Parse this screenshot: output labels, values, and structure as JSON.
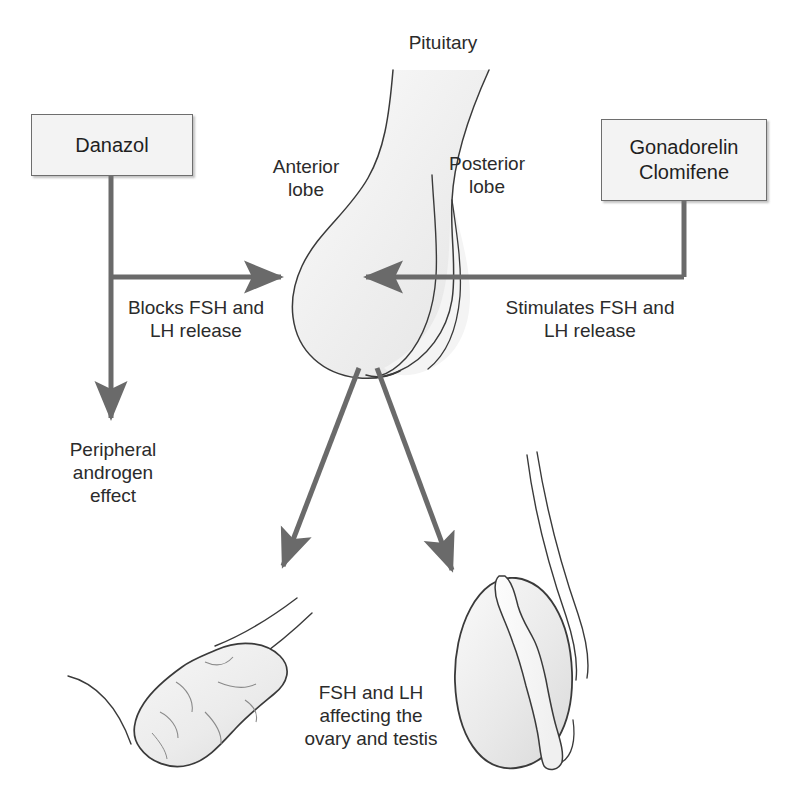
{
  "diagram": {
    "colors": {
      "arrow": "#6a6a6a",
      "outline": "#3a3a3a",
      "organ_fill": "#f0f0f0",
      "box_fill": "#f3f3f3",
      "box_border": "#6e6e6e",
      "text": "#2b2b2b",
      "background": "#ffffff"
    },
    "boxes": [
      {
        "id": "danazol",
        "label": "Danazol"
      },
      {
        "id": "gonadorelin-clomifene",
        "label": "Gonadorelin\nClomifene"
      }
    ],
    "anatomy_labels": [
      {
        "id": "pituitary",
        "text": "Pituitary"
      },
      {
        "id": "anterior-lobe",
        "text": "Anterior\nlobe"
      },
      {
        "id": "posterior-lobe",
        "text": "Posterior\nlobe"
      }
    ],
    "action_labels": [
      {
        "id": "blocks",
        "text": "Blocks FSH and\nLH release"
      },
      {
        "id": "stimulates",
        "text": "Stimulates FSH and\nLH release"
      },
      {
        "id": "peripheral",
        "text": "Peripheral\nandrogen\neffect"
      },
      {
        "id": "gonads",
        "text": "FSH and LH\naffecting the\novary and testis"
      }
    ],
    "arrows": [
      {
        "id": "danazol-to-pituitary",
        "from": "Danazol",
        "to": "Pituitary",
        "kind": "inhibit",
        "direction": "right"
      },
      {
        "id": "danazol-to-peripheral",
        "from": "Danazol",
        "to": "Peripheral androgen effect",
        "kind": "effect",
        "direction": "down"
      },
      {
        "id": "gonadorelin-to-pituitary",
        "from": "Gonadorelin Clomifene",
        "to": "Pituitary",
        "kind": "stimulate",
        "direction": "left"
      },
      {
        "id": "pituitary-to-ovary",
        "from": "Pituitary",
        "to": "Ovary",
        "kind": "release",
        "direction": "down-left"
      },
      {
        "id": "pituitary-to-testis",
        "from": "Pituitary",
        "to": "Testis",
        "kind": "release",
        "direction": "down-right"
      }
    ],
    "organs": [
      {
        "id": "pituitary-gland",
        "name": "pituitary-gland"
      },
      {
        "id": "ovary",
        "name": "ovary"
      },
      {
        "id": "testis",
        "name": "testis"
      }
    ]
  }
}
